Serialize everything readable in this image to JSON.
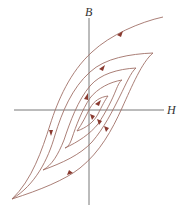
{
  "diagram": {
    "axes": {
      "vertical_label": "B",
      "horizontal_label": "H"
    },
    "colors": {
      "axis": "#6a6a6a",
      "curve": "#a07068",
      "arrow": "#8a3a30",
      "background": "#ffffff"
    },
    "loops": [
      {
        "name": "outer-loop",
        "top_right": [
          153,
          53
        ],
        "bottom_left": [
          12,
          199
        ]
      },
      {
        "name": "second-loop",
        "top_right": [
          136,
          68
        ],
        "bottom_left": [
          43,
          170
        ]
      },
      {
        "name": "third-loop",
        "top_right": [
          122,
          80
        ],
        "bottom_left": [
          65,
          148
        ]
      },
      {
        "name": "inner-loop",
        "top_right": [
          108,
          96
        ],
        "bottom_left": [
          77,
          131
        ]
      }
    ],
    "initial_curve": {
      "start": [
        163,
        17
      ],
      "direction": "descending"
    }
  }
}
